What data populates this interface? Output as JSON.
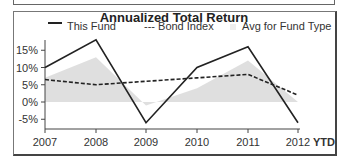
{
  "chart_data": {
    "type": "line",
    "title": "Annualized Total Return",
    "categories": [
      "2007",
      "2008",
      "2009",
      "2010",
      "2011",
      "2012"
    ],
    "x_suffix_label": "YTD",
    "series": [
      {
        "name": "This Fund",
        "style": "solid",
        "values": [
          10,
          18,
          -6,
          10,
          16,
          -6
        ]
      },
      {
        "name": "Bond Index",
        "style": "dashed",
        "values": [
          6.5,
          5,
          6,
          7,
          8,
          2
        ]
      },
      {
        "name": "Avg for Fund Type",
        "style": "area",
        "values": [
          7,
          13,
          -1,
          4,
          12,
          0
        ]
      }
    ],
    "yticks": [
      "15%",
      "10%",
      "5%",
      "0%",
      "-5%"
    ],
    "ylim": [
      -7,
      19
    ],
    "xlabel": "",
    "ylabel": "",
    "legend_position": "top",
    "grid": false
  },
  "legend": {
    "fund": "This Fund",
    "bond": "--- Bond Index",
    "avg": "Avg for Fund Type"
  },
  "colors": {
    "fund": "#222222",
    "bond": "#222222",
    "avg": "#dcdcdc"
  }
}
